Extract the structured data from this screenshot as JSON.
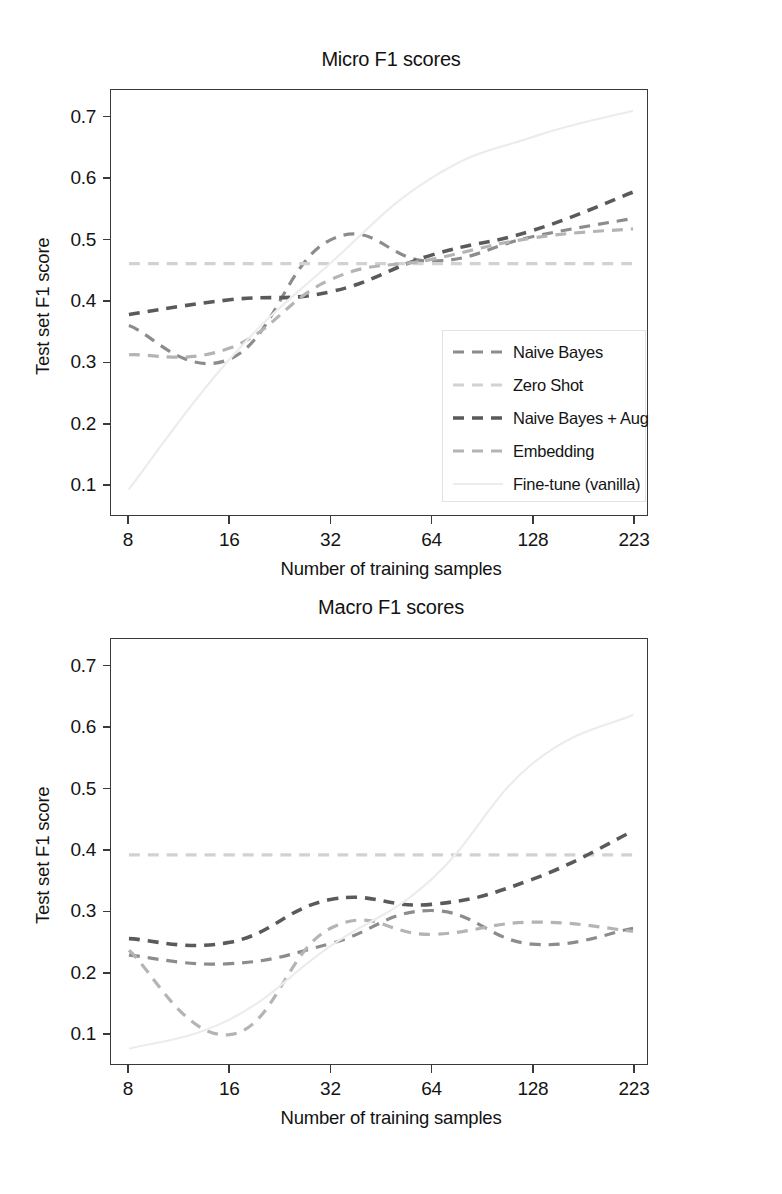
{
  "figures": [
    {
      "title": "Micro F1 scores",
      "xlabel": "Number of training samples",
      "ylabel": "Test set F1 score"
    },
    {
      "title": "Macro F1 scores",
      "xlabel": "Number of training samples",
      "ylabel": "Test set F1 score"
    }
  ],
  "legend": {
    "items": [
      {
        "label": "Naive Bayes",
        "color": "#8c8c8c",
        "dash": "11,8",
        "width": 3.2
      },
      {
        "label": "Zero Shot",
        "color": "#d2d2d2",
        "dash": "11,8",
        "width": 3.2
      },
      {
        "label": "Naive Bayes + Aug",
        "color": "#5a5a5a",
        "dash": "11,8",
        "width": 3.6
      },
      {
        "label": "Embedding",
        "color": "#b4b4b4",
        "dash": "11,8",
        "width": 3.2
      },
      {
        "label": "Fine-tune (vanilla)",
        "color": "#ececec",
        "dash": "none",
        "width": 2.2
      }
    ]
  },
  "axes": {
    "yticks": [
      "0.1",
      "0.2",
      "0.3",
      "0.4",
      "0.5",
      "0.6",
      "0.7"
    ],
    "ytick_values": [
      0.1,
      0.2,
      0.3,
      0.4,
      0.5,
      0.6,
      0.7
    ],
    "xticks": [
      "8",
      "16",
      "32",
      "64",
      "128",
      "223"
    ],
    "xtick_values": [
      8,
      16,
      32,
      64,
      128,
      223
    ],
    "ylim": [
      0.05,
      0.745
    ],
    "grid": false,
    "legend_position": "lower right (micro panel)"
  },
  "chart_data": [
    {
      "type": "line",
      "title": "Micro F1 scores",
      "xlabel": "Number of training samples",
      "ylabel": "Test set F1 score",
      "categories": [
        "8",
        "16",
        "32",
        "64",
        "128",
        "223"
      ],
      "x": [
        8,
        16,
        32,
        64,
        128,
        223
      ],
      "xscale": "categorical (log-spaced sample counts)",
      "ylim": [
        0.05,
        0.745
      ],
      "grid": false,
      "series": [
        {
          "name": "Naive Bayes",
          "color": "#8c8c8c",
          "values": [
            0.36,
            0.305,
            0.5,
            0.465,
            0.505,
            0.535
          ]
        },
        {
          "name": "Zero Shot",
          "color": "#d2d2d2",
          "values": [
            0.461,
            0.461,
            0.461,
            0.461,
            0.461,
            0.461
          ]
        },
        {
          "name": "Naive Bayes + Aug",
          "color": "#5a5a5a",
          "values": [
            0.378,
            0.402,
            0.415,
            0.475,
            0.515,
            0.578
          ]
        },
        {
          "name": "Embedding",
          "color": "#b4b4b4",
          "values": [
            0.312,
            0.323,
            0.435,
            0.468,
            0.503,
            0.518
          ]
        },
        {
          "name": "Fine-tune (vanilla)",
          "color": "#ececec",
          "values": [
            0.092,
            0.305,
            0.462,
            0.601,
            0.668,
            0.711
          ]
        }
      ]
    },
    {
      "type": "line",
      "title": "Macro F1 scores",
      "xlabel": "Number of training samples",
      "ylabel": "Test set F1 score",
      "categories": [
        "8",
        "16",
        "32",
        "64",
        "128",
        "223"
      ],
      "x": [
        8,
        16,
        32,
        64,
        128,
        223
      ],
      "xscale": "categorical (log-spaced sample counts)",
      "ylim": [
        0.05,
        0.745
      ],
      "grid": false,
      "series": [
        {
          "name": "Naive Bayes",
          "color": "#8c8c8c",
          "values": [
            0.228,
            0.214,
            0.247,
            0.301,
            0.246,
            0.272
          ]
        },
        {
          "name": "Zero Shot",
          "color": "#d2d2d2",
          "values": [
            0.392,
            0.392,
            0.392,
            0.392,
            0.392,
            0.392
          ]
        },
        {
          "name": "Naive Bayes + Aug",
          "color": "#5a5a5a",
          "values": [
            0.255,
            0.249,
            0.319,
            0.311,
            0.352,
            0.431
          ]
        },
        {
          "name": "Embedding",
          "color": "#b4b4b4",
          "values": [
            0.236,
            0.098,
            0.272,
            0.262,
            0.282,
            0.267
          ]
        },
        {
          "name": "Fine-tune (vanilla)",
          "color": "#ececec",
          "values": [
            0.075,
            0.123,
            0.243,
            0.352,
            0.541,
            0.621
          ]
        }
      ]
    }
  ]
}
